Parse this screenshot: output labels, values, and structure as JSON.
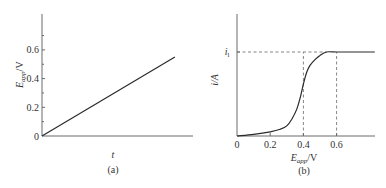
{
  "chart_data": [
    {
      "type": "line",
      "panel_label": "(a)",
      "title": "",
      "xlabel": "t",
      "ylabel": "E_app/V",
      "ylabel_main": "E",
      "ylabel_sub": "app",
      "ylabel_unit": "/V",
      "x_ticks": [],
      "y_ticks": [
        0,
        0.2,
        0.4,
        0.6
      ],
      "y_tick_labels": [
        "0",
        "0.2",
        "0.4",
        "0.6"
      ],
      "ylim": [
        0,
        0.85
      ],
      "xlim": [
        0,
        1
      ],
      "series": [
        {
          "name": "E_app vs t",
          "x": [
            0,
            0.88
          ],
          "y": [
            0,
            0.55
          ]
        }
      ],
      "grid": false
    },
    {
      "type": "line",
      "panel_label": "(b)",
      "title": "",
      "xlabel": "E_app/V",
      "xlabel_main": "E",
      "xlabel_sub": "app",
      "xlabel_unit": "/V",
      "ylabel": "i/A",
      "x_ticks": [
        0,
        0.2,
        0.4,
        0.6
      ],
      "x_tick_labels": [
        "0",
        "0.2",
        "0.4",
        "0.6"
      ],
      "xlim": [
        0,
        0.83
      ],
      "ylim": [
        0,
        1.3
      ],
      "y_annotation": {
        "label_main": "i",
        "label_sub": "l",
        "value": 1.0
      },
      "reference_lines": [
        {
          "orientation": "horizontal",
          "y": 1.0,
          "style": "dashed"
        },
        {
          "orientation": "vertical",
          "x": 0.4,
          "style": "dashed"
        },
        {
          "orientation": "vertical",
          "x": 0.6,
          "style": "dashed"
        }
      ],
      "series": [
        {
          "name": "i vs E_app",
          "x": [
            0,
            0.1,
            0.2,
            0.26,
            0.3,
            0.33,
            0.36,
            0.38,
            0.4,
            0.42,
            0.44,
            0.47,
            0.5,
            0.54,
            0.6,
            0.7,
            0.83
          ],
          "y": [
            0,
            0.02,
            0.05,
            0.08,
            0.12,
            0.2,
            0.32,
            0.45,
            0.62,
            0.76,
            0.84,
            0.91,
            0.96,
            1.0,
            1.0,
            1.0,
            1.0
          ]
        }
      ],
      "grid": false
    }
  ]
}
